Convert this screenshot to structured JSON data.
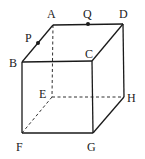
{
  "figure": {
    "type": "cube",
    "vertices": {
      "A": {
        "label": "A",
        "x": 53,
        "y": 25
      },
      "B": {
        "label": "B",
        "x": 22,
        "y": 62
      },
      "C": {
        "label": "C",
        "x": 92,
        "y": 61
      },
      "D": {
        "label": "D",
        "x": 123,
        "y": 24
      },
      "E": {
        "label": "E",
        "x": 52,
        "y": 97
      },
      "F": {
        "label": "F",
        "x": 22,
        "y": 133
      },
      "G": {
        "label": "G",
        "x": 93,
        "y": 133
      },
      "H": {
        "label": "H",
        "x": 124,
        "y": 97
      }
    },
    "points": {
      "P": {
        "label": "P",
        "on_edge": "AB",
        "x": 38,
        "y": 43
      },
      "Q": {
        "label": "Q",
        "on_edge": "AD",
        "x": 88,
        "y": 24
      }
    },
    "visible_edges": [
      "AB",
      "AD",
      "BC",
      "CD",
      "BF",
      "CG",
      "DH",
      "FG",
      "GH"
    ],
    "hidden_edges": [
      "AE",
      "EF",
      "EH"
    ]
  }
}
